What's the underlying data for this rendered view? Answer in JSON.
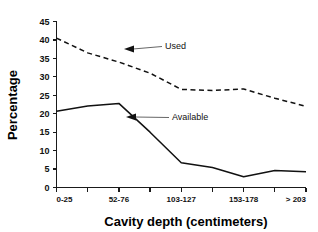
{
  "chart_data": {
    "type": "line",
    "title": "",
    "subtitle": "",
    "xlabel": "Cavity depth (centimeters)",
    "ylabel": "Percentage",
    "ylim": [
      0,
      45
    ],
    "ytick_step": 5,
    "yticks": [
      "0",
      "5",
      "10",
      "15",
      "20",
      "25",
      "30",
      "35",
      "40",
      "45"
    ],
    "grid": false,
    "legend_position": "inline-annotations",
    "categories": [
      "0-25",
      "26-50",
      "52-76",
      "77-101",
      "103-127",
      "128-152",
      "153-178",
      "179-203",
      "> 203"
    ],
    "xtick_labels_visible": [
      "0-25",
      "52-76",
      "103-127",
      "153-178",
      "> 203"
    ],
    "xtick_label_indices": [
      0,
      2,
      4,
      6,
      8
    ],
    "series": [
      {
        "name": "Used",
        "style": "dashed",
        "color": "#111111",
        "values": [
          40.5,
          36.5,
          34.0,
          31.0,
          26.6,
          26.3,
          26.7,
          24.2,
          22.0
        ]
      },
      {
        "name": "Available",
        "style": "solid",
        "color": "#111111",
        "values": [
          20.7,
          22.1,
          22.8,
          15.0,
          6.7,
          5.4,
          2.9,
          4.6,
          4.3
        ]
      }
    ],
    "annotations": [
      {
        "label": "Used",
        "target_series": "Used",
        "target_index": 3
      },
      {
        "label": "Available",
        "target_series": "Available",
        "target_index": 3
      }
    ]
  }
}
